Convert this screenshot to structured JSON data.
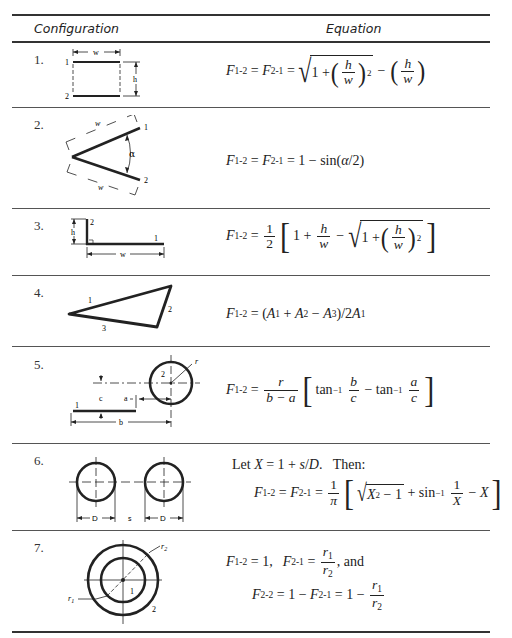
{
  "table": {
    "headers": {
      "configuration": "Configuration",
      "equation": "Equation"
    },
    "rows": [
      {
        "number": "1.",
        "diagram": "parallel-plates",
        "labels": {
          "w": "w",
          "h": "h",
          "s1": "1",
          "s2": "2"
        },
        "equation": {
          "lhs1": "F",
          "lhs1_sub": "1-2",
          "eq1": " = ",
          "lhs2": "F",
          "lhs2_sub": "2-1",
          "eq2": " = ",
          "one": "1 +",
          "h": "h",
          "w": "w",
          "pow": "2",
          "minus": "−"
        }
      },
      {
        "number": "2.",
        "diagram": "inclined-plates",
        "labels": {
          "w_top": "w",
          "w_bottom": "w",
          "alpha": "α",
          "s1": "1",
          "s2": "2"
        },
        "equation": {
          "lhs1": "F",
          "lhs1_sub": "1-2",
          "eq1": " = ",
          "lhs2": "F",
          "lhs2_sub": "2-1",
          "rhs": " = 1 − sin(",
          "alpha": "α",
          "rhs_end": "/2)"
        }
      },
      {
        "number": "3.",
        "diagram": "perpendicular-plates",
        "labels": {
          "h": "h",
          "w": "w",
          "s1": "1",
          "s2": "2"
        },
        "equation": {
          "lhs": "F",
          "lhs_sub": "1-2",
          "eq": " = ",
          "half_num": "1",
          "half_den": "2",
          "one_plus": "1 +",
          "h": "h",
          "w": "w",
          "minus": "−",
          "one": "1 +",
          "pow": "2"
        }
      },
      {
        "number": "4.",
        "diagram": "triangle-enclosure",
        "labels": {
          "s1": "1",
          "s2": "2",
          "s3": "3"
        },
        "equation": {
          "lhs": "F",
          "lhs_sub": "1-2",
          "eq": " = (",
          "a1": "A",
          "a1_sub": "1",
          "plus": " + ",
          "a2": "A",
          "a2_sub": "2",
          "minus": " − ",
          "a3": "A",
          "a3_sub": "3",
          "close": ")/2",
          "a4": "A",
          "a4_sub": "1"
        }
      },
      {
        "number": "5.",
        "diagram": "plate-and-cylinder",
        "labels": {
          "r": "r",
          "c": "c",
          "a": "a",
          "b": "b",
          "s1": "1",
          "s2": "2"
        },
        "equation": {
          "lhs": "F",
          "lhs_sub": "1-2",
          "eq": " = ",
          "r": "r",
          "den": "b − a",
          "tan1": "tan",
          "inv": "−1",
          "b": "b",
          "c1": "c",
          "minus": " − ",
          "tan2": "tan",
          "a": "a",
          "c2": "c"
        }
      },
      {
        "number": "6.",
        "diagram": "parallel-cylinders",
        "labels": {
          "d1": "D",
          "d2": "D",
          "s": "s"
        },
        "equation": {
          "let_prefix": "Let ",
          "X": "X",
          "let_mid": " = 1 + ",
          "s": "s",
          "slash": "/",
          "D": "D",
          "let_end": ".   Then:",
          "lhs1": "F",
          "lhs1_sub": "1-2",
          "eq1": " = ",
          "lhs2": "F",
          "lhs2_sub": "2-1",
          "eq2": " = ",
          "pi_num": "1",
          "pi_den": "π",
          "X2": "X",
          "sq": "2",
          "minus_one": " − 1",
          "plus": " + sin",
          "inv": "−1",
          "one": "1",
          "Xd": "X",
          "minus": " − ",
          "Xe": "X"
        }
      },
      {
        "number": "7.",
        "diagram": "concentric-cylinders",
        "labels": {
          "r1": "r",
          "r1_sub": "1",
          "r2": "r",
          "r2_sub": "2",
          "s1": "1",
          "s2": "2"
        },
        "equation": {
          "line1_lhs": "F",
          "line1_lhs_sub": "1-2",
          "line1_eq": " = 1,",
          "line1_lhs2": "F",
          "line1_lhs2_sub": "2-1",
          "line1_eq2": " = ",
          "r1": "r",
          "r1_sub": "1",
          "r2": "r",
          "r2_sub": "2",
          "and": ", and",
          "line2_lhs": "F",
          "line2_lhs_sub": "2-2",
          "line2_mid": " = 1 − ",
          "line2_f": "F",
          "line2_f_sub": "2-1",
          "line2_end": " = 1 − "
        }
      }
    ]
  },
  "colors": {
    "ink": "#1a1a1a",
    "rule": "#333333",
    "background": "#ffffff"
  }
}
